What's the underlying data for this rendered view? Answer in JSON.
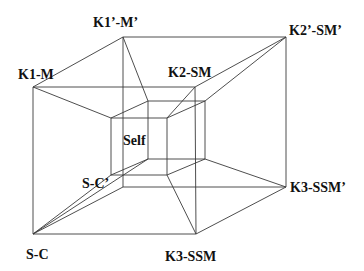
{
  "diagram": {
    "type": "nested-cube-wireframe",
    "labels": {
      "k1_m": "K1-M",
      "k1p_mp": "K1’-M’",
      "k2_sm": "K2-SM",
      "k2p_smp": "K2’-SM’",
      "self": "Self",
      "s_cp": "S-C’",
      "k3_ssmp": "K3-SSM’",
      "s_c": "S-C",
      "k3_ssm": "K3-SSM"
    },
    "line_color": "#3a3a3a",
    "label_color": "#111111"
  }
}
